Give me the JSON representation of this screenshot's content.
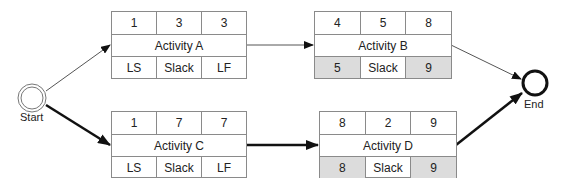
{
  "start": {
    "label": "Start"
  },
  "end": {
    "label": "End"
  },
  "activities": [
    {
      "name": "Activity A",
      "top": [
        "1",
        "3",
        "3"
      ],
      "bottom": [
        "LS",
        "Slack",
        "LF"
      ],
      "bottom_shaded": [
        false,
        false,
        false
      ]
    },
    {
      "name": "Activity B",
      "top": [
        "4",
        "5",
        "8"
      ],
      "bottom": [
        "5",
        "Slack",
        "9"
      ],
      "bottom_shaded": [
        true,
        false,
        true
      ]
    },
    {
      "name": "Activity C",
      "top": [
        "1",
        "7",
        "7"
      ],
      "bottom": [
        "LS",
        "Slack",
        "LF"
      ],
      "bottom_shaded": [
        false,
        false,
        false
      ]
    },
    {
      "name": "Activity D",
      "top": [
        "8",
        "2",
        "9"
      ],
      "bottom": [
        "8",
        "Slack",
        "9"
      ],
      "bottom_shaded": [
        true,
        false,
        true
      ]
    }
  ],
  "edges": [
    {
      "from": "Start",
      "to": "Activity A",
      "critical": false
    },
    {
      "from": "Activity A",
      "to": "Activity B",
      "critical": false
    },
    {
      "from": "Activity B",
      "to": "End",
      "critical": false
    },
    {
      "from": "Start",
      "to": "Activity C",
      "critical": true
    },
    {
      "from": "Activity C",
      "to": "Activity D",
      "critical": true
    },
    {
      "from": "Activity D",
      "to": "End",
      "critical": true
    }
  ]
}
